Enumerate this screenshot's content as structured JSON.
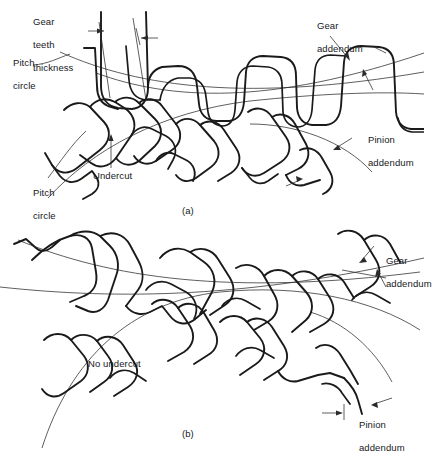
{
  "figure": {
    "panels": [
      {
        "id": "a",
        "caption": "(a)",
        "condition": "undercut",
        "labels": [
          {
            "name": "gear-teeth-thickness",
            "text": "Gear\nteeth\nthickness"
          },
          {
            "name": "pitch-circle-upper",
            "text": "Pitch\ncircle"
          },
          {
            "name": "pitch-circle-lower",
            "text": "Pitch\ncircle"
          },
          {
            "name": "undercut",
            "text": "Undercut"
          },
          {
            "name": "gear-addendum",
            "text": "Gear\naddendum"
          },
          {
            "name": "pinion-addendum",
            "text": "Pinion\naddendum"
          }
        ]
      },
      {
        "id": "b",
        "caption": "(b)",
        "condition": "no undercut",
        "labels": [
          {
            "name": "no-undercut",
            "text": "No undercut"
          },
          {
            "name": "gear-addendum",
            "text": "Gear\naddendum"
          },
          {
            "name": "pinion-addendum",
            "text": "Pinion\naddendum"
          }
        ]
      }
    ],
    "label_text": {
      "gear_teeth_thickness_l1": "Gear",
      "gear_teeth_thickness_l2": "teeth",
      "gear_teeth_thickness_l3": "thickness",
      "pitch_circle_l1": "Pitch",
      "pitch_circle_l2": "circle",
      "pitch_circle_b_l1": "Pitch",
      "pitch_circle_b_l2": "circle",
      "undercut": "Undercut",
      "no_undercut": "No undercut",
      "gear_addendum_l1": "Gear",
      "gear_addendum_l2": "addendum",
      "pinion_addendum_l1": "Pinion",
      "pinion_addendum_l2": "addendum",
      "gear_addendum_b_l1": "Gear",
      "gear_addendum_b_l2": "addendum",
      "pinion_addendum_b_l1": "Pinion",
      "pinion_addendum_b_l2": "addendum",
      "caption_a": "(a)",
      "caption_b": "(b)"
    },
    "colors": {
      "background": "#ffffff",
      "tooth_outline": "#1a1a1a",
      "thin_arc": "#2a2a2a",
      "text": "#15181c"
    }
  }
}
